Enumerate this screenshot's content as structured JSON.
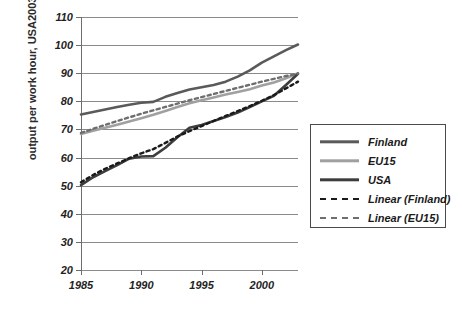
{
  "chart_data": {
    "type": "line",
    "title": "",
    "xlabel": "",
    "ylabel": "output per work hour, USA2003=100",
    "xlim": [
      1985,
      2003
    ],
    "ylim": [
      20,
      110
    ],
    "ytick_step": 10,
    "yticks": [
      110,
      100,
      90,
      80,
      70,
      60,
      50,
      40,
      30,
      20
    ],
    "xticks": [
      1985,
      1990,
      1995,
      2000
    ],
    "grid": "horizontal",
    "legend_position": "right",
    "x": [
      1985,
      1986,
      1987,
      1988,
      1989,
      1990,
      1991,
      1992,
      1993,
      1994,
      1995,
      1996,
      1997,
      1998,
      1999,
      2000,
      2001,
      2002,
      2003
    ],
    "series": [
      {
        "name": "Finland",
        "style": "solid",
        "color": "#5a5a5a",
        "values": [
          75.3,
          76.2,
          77.1,
          78.0,
          78.8,
          79.5,
          79.8,
          81.6,
          83.0,
          84.2,
          85.0,
          85.8,
          87.0,
          88.8,
          91.0,
          93.8,
          96.0,
          98.2,
          100.2
        ]
      },
      {
        "name": "EU15",
        "style": "solid",
        "color": "#a0a0a0",
        "values": [
          68.4,
          69.5,
          70.6,
          71.7,
          72.8,
          74.0,
          75.2,
          76.6,
          78.0,
          79.3,
          80.4,
          81.4,
          82.4,
          83.3,
          84.3,
          85.6,
          86.7,
          88.2,
          90.0
        ]
      },
      {
        "name": "USA",
        "style": "solid",
        "color": "#3d3d3d",
        "values": [
          50.2,
          53.0,
          55.2,
          57.3,
          59.6,
          60.4,
          60.5,
          63.5,
          67.2,
          70.6,
          71.6,
          73.0,
          74.4,
          76.0,
          78.0,
          80.0,
          82.0,
          85.8,
          89.8
        ]
      },
      {
        "name": "Linear (Finland)",
        "style": "dashed",
        "color": "#1a1a1a",
        "values": [
          51.2,
          53.8,
          56.0,
          57.9,
          59.8,
          61.5,
          63.0,
          65.2,
          67.5,
          69.4,
          71.2,
          73.0,
          74.8,
          76.5,
          78.3,
          80.2,
          82.2,
          84.6,
          87.0
        ]
      },
      {
        "name": "Linear (EU15)",
        "style": "dashed",
        "color": "#6e6e6e",
        "values": [
          68.8,
          70.2,
          71.6,
          73.0,
          74.3,
          75.6,
          76.8,
          78.0,
          79.2,
          80.4,
          81.5,
          82.6,
          83.7,
          84.8,
          85.9,
          87.0,
          88.0,
          89.0,
          89.8
        ]
      }
    ]
  },
  "legend": {
    "items": [
      {
        "label": "Finland",
        "style": "solid",
        "color": "#5a5a5a"
      },
      {
        "label": "EU15",
        "style": "solid",
        "color": "#a0a0a0"
      },
      {
        "label": "USA",
        "style": "solid",
        "color": "#3d3d3d"
      },
      {
        "label": "Linear (Finland)",
        "style": "dashed",
        "color": "#1a1a1a"
      },
      {
        "label": "Linear (EU15)",
        "style": "dashed",
        "color": "#6e6e6e"
      }
    ]
  }
}
